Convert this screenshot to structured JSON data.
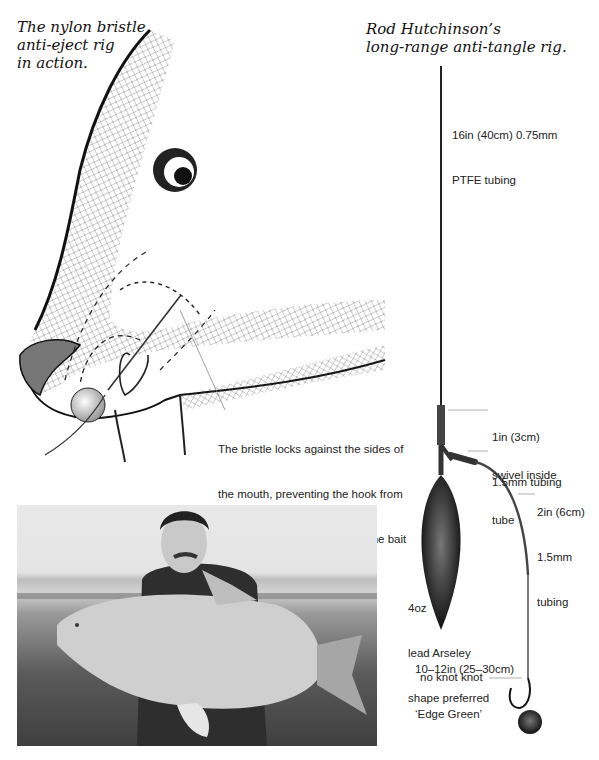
{
  "left_figure": {
    "title_lines": [
      "The nylon bristle",
      "anti-eject rig",
      "in action."
    ],
    "annotation_lines": [
      "The bristle locks against the sides of",
      "the mouth, preventing the hook from",
      "doing a ‘U’ turn and following the bait",
      "out of the carp’s mouth."
    ]
  },
  "right_figure": {
    "title_lines": [
      "Rod Hutchinson’s",
      "long-range anti-tangle rig."
    ],
    "labels": {
      "ptfe": [
        "16in (40cm) 0.75mm",
        "PTFE tubing"
      ],
      "tubing_1in": [
        "1in (3cm)",
        "1.5mm tubing"
      ],
      "swivel": [
        "swivel inside",
        "tube"
      ],
      "tubing_2in": [
        "2in (6cm)",
        "1.5mm",
        "tubing"
      ],
      "lead": [
        "4oz",
        "lead Arseley",
        "shape preferred"
      ],
      "hooklink": [
        "10–12in (25–30cm)",
        "‘Edge Green’"
      ],
      "knot": "no knot knot"
    }
  },
  "photo": {
    "description": "Angler kneeling holding a large mirror carp on a lake shore"
  }
}
